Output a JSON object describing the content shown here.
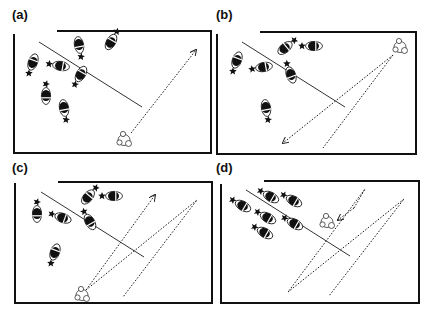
{
  "figure": {
    "width": 430,
    "height": 313,
    "colors": {
      "ink": "#111111",
      "background": "#ffffff"
    },
    "panels": [
      {
        "id": "a",
        "label": "(a)",
        "label_pos": [
          12,
          19
        ],
        "frame": {
          "left": 14,
          "right": 211,
          "bottom": 153,
          "left_top": 34,
          "top_y": 31,
          "top_start": 57
        },
        "barrier": [
          [
            39,
            42
          ],
          [
            142,
            107
          ]
        ],
        "cows": [
          {
            "x": 33,
            "y": 62,
            "angle": -70,
            "star": "top"
          },
          {
            "x": 79,
            "y": 45,
            "angle": 80,
            "star": "bottom"
          },
          {
            "x": 111,
            "y": 42,
            "angle": -60,
            "star": "bottom"
          },
          {
            "x": 61,
            "y": 66,
            "angle": 10,
            "star": "left"
          },
          {
            "x": 81,
            "y": 74,
            "angle": -60,
            "star": "top"
          },
          {
            "x": 46,
            "y": 96,
            "angle": 90,
            "star": "top"
          },
          {
            "x": 64,
            "y": 108,
            "angle": 80,
            "star": "bottom"
          }
        ],
        "dog": {
          "x": 124,
          "y": 140
        },
        "paths": [
          {
            "points": [
              [
                131,
                133
              ],
              [
                196,
                50
              ]
            ],
            "arrow": true
          }
        ]
      },
      {
        "id": "b",
        "label": "(b)",
        "label_pos": [
          216,
          19
        ],
        "frame": {
          "left": 217,
          "right": 416,
          "bottom": 154,
          "left_top": 34,
          "top_y": 32,
          "top_start": 260
        },
        "barrier": [
          [
            242,
            42
          ],
          [
            345,
            107
          ]
        ],
        "cows": [
          {
            "x": 237,
            "y": 60,
            "angle": -70,
            "star": "top"
          },
          {
            "x": 285,
            "y": 48,
            "angle": -40,
            "star": "bottom"
          },
          {
            "x": 314,
            "y": 46,
            "angle": 0,
            "star": "left"
          },
          {
            "x": 264,
            "y": 67,
            "angle": -10,
            "star": "left"
          },
          {
            "x": 291,
            "y": 75,
            "angle": 70,
            "star": "top"
          },
          {
            "x": 266,
            "y": 108,
            "angle": 80,
            "star": "bottom"
          }
        ],
        "dog": {
          "x": 400,
          "y": 47
        },
        "paths": [
          {
            "points": [
              [
                393,
                55
              ],
              [
                283,
                143
              ]
            ],
            "arrow": true
          },
          {
            "points": [
              [
                393,
                55
              ],
              [
                323,
                148
              ]
            ],
            "arrow": false
          }
        ]
      },
      {
        "id": "c",
        "label": "(c)",
        "label_pos": [
          12,
          172
        ],
        "frame": {
          "left": 15,
          "right": 212,
          "bottom": 303,
          "left_top": 183,
          "top_y": 182,
          "top_start": 58
        },
        "barrier": [
          [
            41,
            192
          ],
          [
            144,
            257
          ]
        ],
        "cows": [
          {
            "x": 37,
            "y": 214,
            "angle": 90,
            "star": "top"
          },
          {
            "x": 63,
            "y": 218,
            "angle": 20,
            "star": "left"
          },
          {
            "x": 88,
            "y": 197,
            "angle": -50,
            "star": "bottom"
          },
          {
            "x": 114,
            "y": 196,
            "angle": 0,
            "star": "left"
          },
          {
            "x": 90,
            "y": 222,
            "angle": 60,
            "star": "top"
          },
          {
            "x": 55,
            "y": 252,
            "angle": -70,
            "star": "top"
          }
        ],
        "dog": {
          "x": 82,
          "y": 295
        },
        "paths": [
          {
            "points": [
              [
                86,
                290
              ],
              [
                155,
                195
              ]
            ],
            "arrow": true
          },
          {
            "points": [
              [
                86,
                290
              ],
              [
                197,
                200
              ],
              [
                123,
                297
              ]
            ],
            "arrow": false
          }
        ]
      },
      {
        "id": "d",
        "label": "(d)",
        "label_pos": [
          216,
          172
        ],
        "frame": {
          "left": 221,
          "right": 419,
          "bottom": 303,
          "left_top": 184,
          "top_y": 181,
          "top_start": 264
        },
        "barrier": [
          [
            246,
            190
          ],
          [
            350,
            256
          ]
        ],
        "cows": [
          {
            "x": 243,
            "y": 206,
            "angle": 30,
            "star": "left"
          },
          {
            "x": 271,
            "y": 197,
            "angle": 30,
            "star": "left"
          },
          {
            "x": 294,
            "y": 201,
            "angle": 30,
            "star": "left"
          },
          {
            "x": 268,
            "y": 218,
            "angle": 30,
            "star": "left"
          },
          {
            "x": 295,
            "y": 224,
            "angle": 30,
            "star": "left"
          },
          {
            "x": 265,
            "y": 233,
            "angle": 30,
            "star": "left"
          }
        ],
        "dog": {
          "x": 327,
          "y": 222
        },
        "paths": [
          {
            "points": [
              [
                354,
                208
              ],
              [
                338,
                220
              ]
            ],
            "arrow": true
          },
          {
            "points": [
              [
                354,
                208
              ],
              [
                365,
                189
              ],
              [
                288,
                292
              ],
              [
                404,
                199
              ],
              [
                329,
                296
              ]
            ],
            "arrow": false
          }
        ]
      }
    ]
  }
}
